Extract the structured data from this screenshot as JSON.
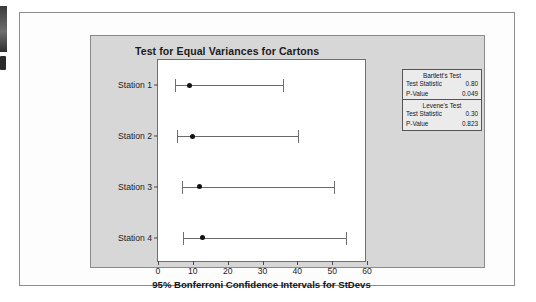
{
  "figure": {
    "title": "Test for Equal Variances for Cartons"
  },
  "chart_data": {
    "type": "error-bar",
    "title": "Test for Equal Variances for Cartons",
    "xlabel": "95% Bonferroni Confidence Intervals for StDevs",
    "ylabel": "",
    "xlim": [
      0,
      60
    ],
    "xticks": [
      0,
      10,
      20,
      30,
      40,
      50,
      60
    ],
    "grid": false,
    "orientation": "horizontal",
    "categories": [
      "Station 1",
      "Station 2",
      "Station 3",
      "Station 4"
    ],
    "series": [
      {
        "name": "95% Bonferroni CI for StDev",
        "points": [
          {
            "category": "Station 1",
            "value": 9.0,
            "lower": 5.0,
            "upper": 36.0
          },
          {
            "category": "Station 2",
            "value": 9.8,
            "lower": 5.5,
            "upper": 40.2
          },
          {
            "category": "Station 3",
            "value": 11.8,
            "lower": 6.8,
            "upper": 50.5
          },
          {
            "category": "Station 4",
            "value": 12.8,
            "lower": 7.2,
            "upper": 54.0
          }
        ]
      }
    ],
    "annotations": {
      "bartlett_test": {
        "label": "Bartlett's Test",
        "test_statistic": "0.80",
        "p_value": "0.049"
      },
      "levene_test": {
        "label": "Levene's Test",
        "test_statistic": "0.30",
        "p_value": "0.823"
      }
    }
  },
  "stats_box": {
    "sections": [
      {
        "heading": "Bartlett's Test",
        "rows": [
          {
            "key": "Test Statistic",
            "value": "0.80"
          },
          {
            "key": "P-Value",
            "value": "0.049"
          }
        ]
      },
      {
        "heading": "Levene's Test",
        "rows": [
          {
            "key": "Test Statistic",
            "value": "0.30"
          },
          {
            "key": "P-Value",
            "value": "0.823"
          }
        ]
      }
    ]
  }
}
